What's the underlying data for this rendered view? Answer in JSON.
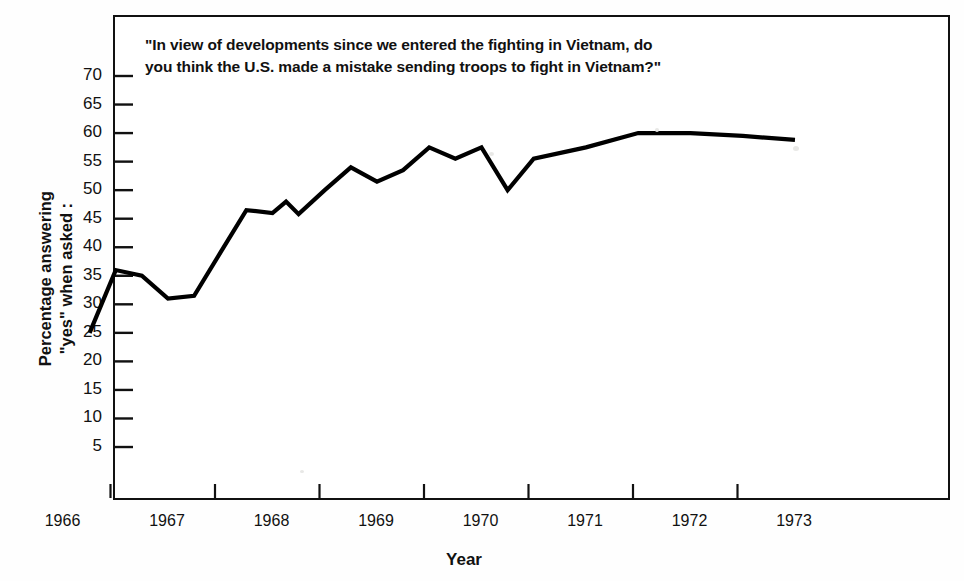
{
  "chart_data": {
    "type": "line",
    "title": "\"In view of developments since we entered the fighting in Vietnam, do you think the U.S. made a mistake sending troops to fight in Vietnam?\"",
    "title_line1": "\"In view of developments since we entered the fighting in Vietnam, do",
    "title_line2": "you think the U.S. made a mistake sending troops to fight in Vietnam?\"",
    "xlabel": "Year",
    "ylabel": "Percentage answering \"yes\" when asked :",
    "ylabel_line1": "Percentage answering",
    "ylabel_line2": "\"yes\" when asked :",
    "grid": false,
    "legend": "none",
    "line_color": "#000000",
    "ylim": [
      0,
      72.5
    ],
    "yticks": [
      70,
      65,
      60,
      55,
      50,
      45,
      40,
      35,
      30,
      25,
      20,
      15,
      10,
      5
    ],
    "xticks": [
      1966,
      1967,
      1968,
      1969,
      1970,
      1971,
      1972,
      1973
    ],
    "xlim": [
      1965.75,
      1973.2
    ],
    "series": [
      {
        "name": "Percentage answering yes",
        "x": [
          1965.8,
          1966.05,
          1966.3,
          1966.55,
          1966.8,
          1967.05,
          1967.3,
          1967.55,
          1967.68,
          1967.8,
          1968.05,
          1968.3,
          1968.55,
          1968.8,
          1969.05,
          1969.3,
          1969.55,
          1969.8,
          1970.05,
          1970.55,
          1971.05,
          1971.55,
          1972.05,
          1972.55
        ],
        "values": [
          25,
          36,
          35,
          31,
          31.5,
          39,
          46.5,
          46,
          48,
          45.8,
          50,
          54,
          51.5,
          53.5,
          57.5,
          55.5,
          57.5,
          50,
          55.5,
          57.5,
          60,
          60,
          59.5,
          58.8
        ]
      }
    ]
  },
  "axis": {
    "ylabel_line1": "Percentage answering",
    "ylabel_line2": "\"yes\" when asked :",
    "xlabel": "Year"
  }
}
